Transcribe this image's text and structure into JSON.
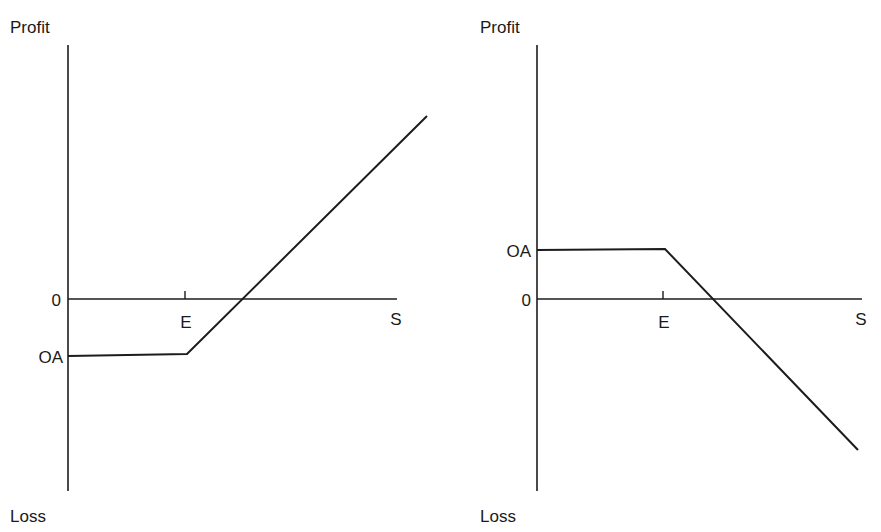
{
  "figure": {
    "background_color": "#ffffff",
    "line_color": "#1c1c1c",
    "charts": [
      {
        "id": "left-chart",
        "name": "long-call-payoff",
        "y_axis_top_label": "Profit",
        "y_axis_bottom_label": "Loss",
        "x_axis_label": "S",
        "zero_label": "0",
        "premium_label": "OA",
        "strike_label": "E"
      },
      {
        "id": "right-chart",
        "name": "short-put-payoff",
        "y_axis_top_label": "Profit",
        "y_axis_bottom_label": "Loss",
        "x_axis_label": "S",
        "zero_label": "0",
        "premium_label": "OA",
        "strike_label": "E"
      }
    ]
  },
  "chart_data": [
    {
      "type": "line",
      "id": "left-chart",
      "title": "",
      "subtitle": "",
      "xlabel": "S",
      "ylabel": "Profit",
      "annotations": [
        "Profit",
        "Loss",
        "0",
        "OA",
        "E",
        "S"
      ],
      "grid": false,
      "legend": false,
      "x_axis": {
        "name": "S",
        "tick_labels": [
          "E",
          "S"
        ],
        "tick_values": [
          100,
          277
        ],
        "zero_at_pixel_x": 68,
        "end_pixel_x": 397,
        "axis_pixel_y": 299
      },
      "y_axis": {
        "name": "Profit / Loss",
        "tick_labels": [
          "0",
          "OA"
        ],
        "tick_values": [
          0,
          -48
        ],
        "top_pixel_y": 45,
        "bottom_pixel_y": 491,
        "axis_pixel_x": 68
      },
      "series": [
        {
          "name": "Long call payoff",
          "points": [
            {
              "x": 0,
              "y": -48,
              "px": 68,
              "py": 356
            },
            {
              "x": 100,
              "y": -48,
              "px": 187,
              "py": 354
            },
            {
              "x": 302,
              "y": 200,
              "px": 427,
              "py": 116
            }
          ],
          "breakeven_px": {
            "px": 240,
            "py": 299
          }
        }
      ]
    },
    {
      "type": "line",
      "id": "right-chart",
      "title": "",
      "subtitle": "",
      "xlabel": "S",
      "ylabel": "Profit",
      "annotations": [
        "Profit",
        "Loss",
        "OA",
        "0",
        "E",
        "S"
      ],
      "grid": false,
      "legend": false,
      "x_axis": {
        "name": "S",
        "tick_labels": [
          "E",
          "S"
        ],
        "tick_values": [
          100,
          254
        ],
        "zero_at_pixel_x": 537,
        "end_pixel_x": 862,
        "axis_pixel_y": 299
      },
      "y_axis": {
        "name": "Profit / Loss",
        "tick_labels": [
          "OA",
          "0"
        ],
        "tick_values": [
          41,
          0
        ],
        "top_pixel_y": 45,
        "bottom_pixel_y": 491,
        "axis_pixel_x": 537
      },
      "series": [
        {
          "name": "Short put payoff",
          "points": [
            {
              "x": 0,
              "y": 41,
              "px": 537,
              "py": 250
            },
            {
              "x": 100,
              "y": 41,
              "px": 665,
              "py": 249
            },
            {
              "x": 251,
              "y": -127,
              "px": 858,
              "py": 450
            }
          ],
          "breakeven_px": {
            "px": 710,
            "py": 299
          }
        }
      ]
    }
  ]
}
